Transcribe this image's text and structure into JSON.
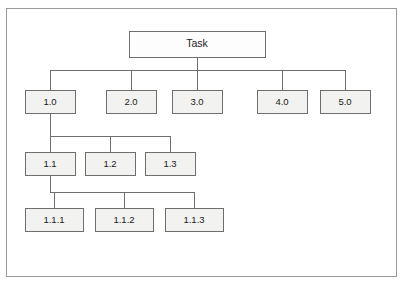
{
  "figure": {
    "frame": {
      "x": 6,
      "y": 8,
      "width": 391,
      "height": 269,
      "border_color": "#9a9a9a",
      "background_color": "#ffffff"
    },
    "style": {
      "box_fill": "#f2f2f0",
      "root_box_fill": "#fdfdfd",
      "box_stroke": "#6e6e6e",
      "connector_color": "#6e6e6e",
      "text_color": "#1a1a1a"
    }
  },
  "nodes": [
    {
      "id": "task",
      "label": "Task",
      "level": 0,
      "x": 129,
      "y": 31,
      "width": 136,
      "height": 26
    },
    {
      "id": "1.0",
      "label": "1.0",
      "level": 1,
      "x": 25,
      "y": 90,
      "width": 50,
      "height": 23
    },
    {
      "id": "2.0",
      "label": "2.0",
      "level": 1,
      "x": 106,
      "y": 90,
      "width": 50,
      "height": 23
    },
    {
      "id": "3.0",
      "label": "3.0",
      "level": 1,
      "x": 172,
      "y": 90,
      "width": 50,
      "height": 23
    },
    {
      "id": "4.0",
      "label": "4.0",
      "level": 1,
      "x": 257,
      "y": 90,
      "width": 50,
      "height": 23
    },
    {
      "id": "5.0",
      "label": "5.0",
      "level": 1,
      "x": 320,
      "y": 90,
      "width": 50,
      "height": 23
    },
    {
      "id": "1.1",
      "label": "1.1",
      "level": 2,
      "x": 25,
      "y": 152,
      "width": 50,
      "height": 23
    },
    {
      "id": "1.2",
      "label": "1.2",
      "level": 2,
      "x": 85,
      "y": 152,
      "width": 50,
      "height": 23
    },
    {
      "id": "1.3",
      "label": "1.3",
      "level": 2,
      "x": 145,
      "y": 152,
      "width": 50,
      "height": 23
    },
    {
      "id": "1.1.1",
      "label": "1.1.1",
      "level": 3,
      "x": 25,
      "y": 208,
      "width": 58,
      "height": 23
    },
    {
      "id": "1.1.2",
      "label": "1.1.2",
      "level": 3,
      "x": 95,
      "y": 208,
      "width": 58,
      "height": 23
    },
    {
      "id": "1.1.3",
      "label": "1.1.3",
      "level": 3,
      "x": 165,
      "y": 208,
      "width": 58,
      "height": 23
    }
  ],
  "edge_groups": [
    {
      "parent": "task",
      "children": [
        "1.0",
        "2.0",
        "3.0",
        "4.0",
        "5.0"
      ],
      "bus_y": 70
    },
    {
      "parent": "1.0",
      "children": [
        "1.1",
        "1.2",
        "1.3"
      ],
      "bus_y": 136
    },
    {
      "parent": "1.1",
      "children": [
        "1.1.1",
        "1.1.2",
        "1.1.3"
      ],
      "bus_y": 192
    }
  ]
}
